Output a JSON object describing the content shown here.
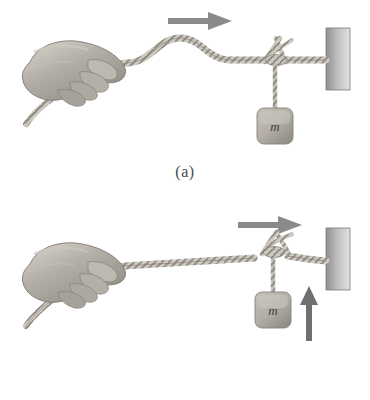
{
  "figure": {
    "background_color": "#ffffff",
    "ink_color": "#6e6e6e",
    "rope_color": "#9a968f",
    "arrow_color": "#8a8a8a",
    "wall_color_dark": "#8e8e8e",
    "wall_color_light": "#d8d8d8",
    "block_color": "#b4b0a8",
    "hand_color": "#a9a49c"
  },
  "panels": [
    {
      "id": "a",
      "caption": "(a)",
      "hand": {
        "name": "hand-gripping-rope"
      },
      "rope": {
        "name": "rope",
        "shape": "pulse"
      },
      "pulse": {
        "label": "",
        "direction": "right"
      },
      "direction_arrow": {
        "name": "pulse-direction-arrow",
        "label": "",
        "orientation": "right"
      },
      "knot": {
        "name": "knot"
      },
      "mass_block": {
        "label": "m"
      },
      "wall": {
        "name": "wall"
      }
    },
    {
      "id": "b",
      "caption": "(b)",
      "hand": {
        "name": "hand-gripping-rope"
      },
      "rope": {
        "name": "rope",
        "shape": "straight"
      },
      "pulse": {
        "label": "",
        "direction": "right"
      },
      "direction_arrow": {
        "name": "pulse-direction-arrow",
        "label": "",
        "orientation": "right"
      },
      "knot": {
        "name": "knot"
      },
      "mass_block": {
        "label": "m"
      },
      "wall": {
        "name": "wall"
      },
      "acceleration_arrow": {
        "name": "mass-acceleration-arrow",
        "label": "",
        "orientation": "up"
      }
    }
  ]
}
